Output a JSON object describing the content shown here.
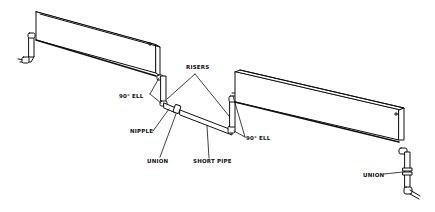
{
  "diagram": {
    "colors": {
      "line": "#111111",
      "background": "#ffffff"
    },
    "labels": {
      "risers": "RISERS",
      "ell_left": "90° ELL",
      "ell_right": "90° ELL",
      "nipple": "NIPPLE",
      "union_center": "UNION",
      "short_pipe": "SHORT PIPE",
      "union_right": "UNION"
    }
  }
}
